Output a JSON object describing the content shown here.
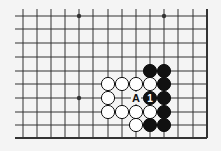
{
  "diagram": {
    "type": "go-board-fragment",
    "grid": {
      "x_lines": [
        23,
        37,
        51,
        65,
        79,
        93,
        108,
        122,
        136,
        150,
        164,
        178,
        193,
        207
      ],
      "y_lines": [
        16,
        29,
        43,
        57,
        71,
        84,
        98,
        112,
        125,
        138
      ],
      "left_extent": 15,
      "top_extent": 9,
      "right_edge_x": 207,
      "bottom_edge_y": 138
    },
    "star_points": [
      {
        "col": 4,
        "row": 0
      },
      {
        "col": 10,
        "row": 0
      },
      {
        "col": 4,
        "row": 6
      }
    ],
    "stones": [
      {
        "color": "black",
        "col": 9,
        "row": 4
      },
      {
        "color": "black",
        "col": 10,
        "row": 4
      },
      {
        "color": "white",
        "col": 6,
        "row": 5
      },
      {
        "color": "white",
        "col": 7,
        "row": 5
      },
      {
        "color": "white",
        "col": 8,
        "row": 5
      },
      {
        "color": "white",
        "col": 9,
        "row": 5
      },
      {
        "color": "black",
        "col": 10,
        "row": 5
      },
      {
        "color": "white",
        "col": 6,
        "row": 6
      },
      {
        "color": "black",
        "col": 9,
        "row": 6,
        "label": "1"
      },
      {
        "color": "black",
        "col": 10,
        "row": 6
      },
      {
        "color": "white",
        "col": 6,
        "row": 7
      },
      {
        "color": "white",
        "col": 7,
        "row": 7
      },
      {
        "color": "white",
        "col": 8,
        "row": 7
      },
      {
        "color": "white",
        "col": 9,
        "row": 7
      },
      {
        "color": "black",
        "col": 10,
        "row": 7
      },
      {
        "color": "white",
        "col": 8,
        "row": 8
      },
      {
        "color": "black",
        "col": 9,
        "row": 8
      },
      {
        "color": "black",
        "col": 10,
        "row": 8
      }
    ],
    "point_labels": [
      {
        "col": 8,
        "row": 6,
        "text": "A"
      }
    ],
    "colors": {
      "line": "#333333",
      "black_stone": "#111111",
      "white_stone": "#ffffff",
      "background": "#f4f4f4"
    }
  }
}
